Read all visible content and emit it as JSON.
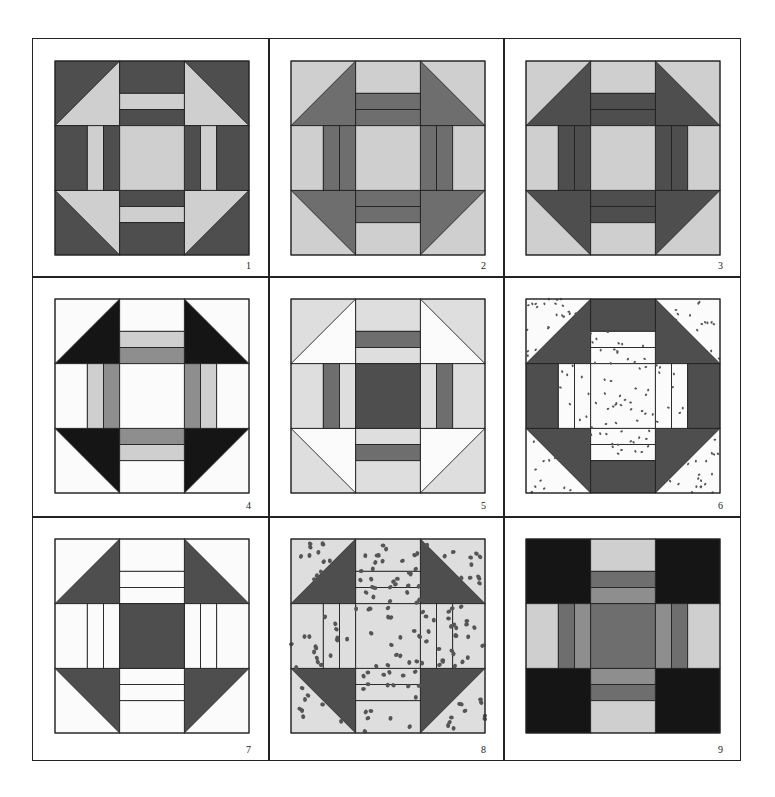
{
  "colors": {
    "black": "#151515",
    "dark": "#4e4e4e",
    "mid": "#6e6e6e",
    "medium": "#8e8e8e",
    "light": "#cfcfcf",
    "lighter": "#dedede",
    "white": "#fbfbfb",
    "line": "#222222"
  },
  "blocks": [
    {
      "number": "1",
      "corner_bg": "dark",
      "corner_tri": "light",
      "bar_outer": "dark",
      "bar_mid": "light",
      "bar_inner": "dark",
      "center": "light",
      "spotted": false
    },
    {
      "number": "2",
      "corner_bg": "light",
      "corner_tri": "mid",
      "bar_outer": "light",
      "bar_mid": "mid",
      "bar_inner": "mid",
      "center": "light",
      "spotted": false
    },
    {
      "number": "3",
      "corner_bg": "light",
      "corner_tri": "dark",
      "bar_outer": "light",
      "bar_mid": "dark",
      "bar_inner": "dark",
      "center": "light",
      "spotted": false
    },
    {
      "number": "4",
      "corner_bg": "white",
      "corner_tri": "black",
      "bar_outer": "white",
      "bar_mid": "light",
      "bar_inner": "medium",
      "center": "white",
      "spotted": false
    },
    {
      "number": "5",
      "corner_bg": "lighter",
      "corner_tri": "white",
      "bar_outer": "lighter",
      "bar_mid": "mid",
      "bar_inner": "lighter",
      "center": "dark",
      "spotted": false
    },
    {
      "number": "6",
      "corner_bg": "white",
      "corner_tri": "dark",
      "bar_outer": "dark",
      "bar_mid": "white",
      "bar_inner": "white",
      "center": "white",
      "spotted": true
    },
    {
      "number": "7",
      "corner_bg": "white",
      "corner_tri": "dark",
      "bar_outer": "white",
      "bar_mid": "white",
      "bar_inner": "white",
      "center": "dark",
      "spotted": false
    },
    {
      "number": "8",
      "corner_bg": "lighter",
      "corner_tri": "dark",
      "bar_outer": "lighter",
      "bar_mid": "lighter",
      "bar_inner": "lighter",
      "center": "lighter",
      "spotted": true
    },
    {
      "number": "9",
      "corner_bg": "black",
      "corner_tri": "black",
      "bar_outer": "light",
      "bar_mid": "mid",
      "bar_inner": "medium",
      "center": "mid",
      "spotted": false
    }
  ]
}
